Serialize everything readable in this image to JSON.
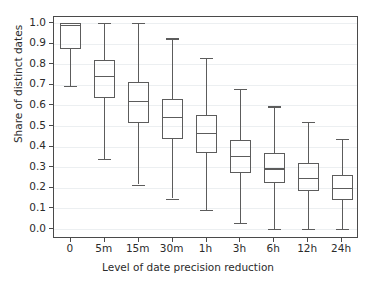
{
  "chart_data": {
    "type": "box",
    "title": "",
    "xlabel": "Level of date precision reduction",
    "ylabel": "Share of distinct dates",
    "categories": [
      "0",
      "5m",
      "15m",
      "30m",
      "1h",
      "3h",
      "6h",
      "12h",
      "24h"
    ],
    "ylim": [
      -0.03,
      1.05
    ],
    "yticks": [
      "0.0",
      "0.1",
      "0.2",
      "0.3",
      "0.4",
      "0.5",
      "0.6",
      "0.7",
      "0.8",
      "0.9",
      "1.0"
    ],
    "ytick_values": [
      0.0,
      0.1,
      0.2,
      0.3,
      0.4,
      0.5,
      0.6,
      0.7,
      0.8,
      0.9,
      1.0
    ],
    "grid": true,
    "grid_axis": "y",
    "legend": "none",
    "box_color": "#5c5c5c",
    "grid_color": "#eceff1",
    "axis_color": "#4a4a4a",
    "boxes": [
      {
        "category": "0",
        "whislo": 0.695,
        "q1": 0.873,
        "med": 0.99,
        "q3": 1.0,
        "whishi": 1.0
      },
      {
        "category": "5m",
        "whislo": 0.342,
        "q1": 0.635,
        "med": 0.745,
        "q3": 0.822,
        "whishi": 1.0
      },
      {
        "category": "15m",
        "whislo": 0.216,
        "q1": 0.513,
        "med": 0.623,
        "q3": 0.712,
        "whishi": 1.0
      },
      {
        "category": "30m",
        "whislo": 0.148,
        "q1": 0.436,
        "med": 0.546,
        "q3": 0.633,
        "whishi": 0.925
      },
      {
        "category": "1h",
        "whislo": 0.092,
        "q1": 0.367,
        "med": 0.466,
        "q3": 0.554,
        "whishi": 0.832
      },
      {
        "category": "3h",
        "whislo": 0.028,
        "q1": 0.272,
        "med": 0.354,
        "q3": 0.433,
        "whishi": 0.68
      },
      {
        "category": "6h",
        "whislo": 0.0,
        "q1": 0.225,
        "med": 0.294,
        "q3": 0.369,
        "whishi": 0.595
      },
      {
        "category": "12h",
        "whislo": 0.0,
        "q1": 0.185,
        "med": 0.25,
        "q3": 0.318,
        "whishi": 0.521
      },
      {
        "category": "24h",
        "whislo": 0.0,
        "q1": 0.143,
        "med": 0.201,
        "q3": 0.264,
        "whishi": 0.436
      }
    ]
  }
}
